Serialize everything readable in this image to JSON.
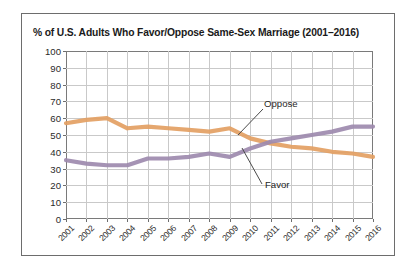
{
  "chart_data": {
    "type": "line",
    "title": "% of U.S. Adults Who Favor/Oppose Same-Sex Marriage (2001–2016)",
    "xlabel": "",
    "ylabel": "",
    "ylim": [
      0,
      100
    ],
    "ytick_labels": [
      "100",
      "90",
      "80",
      "70",
      "60",
      "50",
      "40",
      "30",
      "20",
      "10",
      "0"
    ],
    "ytick_values": [
      100,
      90,
      80,
      70,
      60,
      50,
      40,
      30,
      20,
      10,
      0
    ],
    "grid": true,
    "legend_position": "inline-annotations",
    "categories": [
      "2001",
      "2002",
      "2003",
      "2004",
      "2005",
      "2006",
      "2007",
      "2008",
      "2009",
      "2010",
      "2011",
      "2012",
      "2013",
      "2014",
      "2015",
      "2016"
    ],
    "series": [
      {
        "name": "Oppose",
        "color": "#e3a063",
        "values": [
          57,
          59,
          60,
          54,
          55,
          54,
          53,
          52,
          54,
          48,
          45,
          43,
          42,
          40,
          39,
          37
        ]
      },
      {
        "name": "Favor",
        "color": "#9d8aae",
        "values": [
          35,
          33,
          32,
          32,
          36,
          36,
          37,
          39,
          37,
          42,
          46,
          48,
          50,
          52,
          55,
          55
        ]
      }
    ],
    "annotations": [
      {
        "text": "Oppose",
        "series": "Oppose"
      },
      {
        "text": "Favor",
        "series": "Favor"
      }
    ]
  }
}
